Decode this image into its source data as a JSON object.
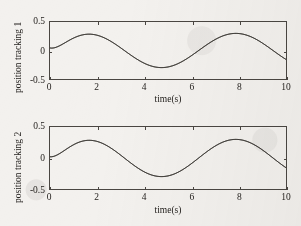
{
  "page": {
    "top_partial_text": "",
    "background_color": "#f3f1ee",
    "ink_color": "#262320",
    "curve_color": "#3a3632"
  },
  "chart_data": [
    {
      "type": "line",
      "title": "",
      "xlabel": "time(s)",
      "ylabel": "position tracking 1",
      "xlim": [
        0,
        10
      ],
      "ylim": [
        -0.5,
        0.5
      ],
      "xticks": [
        0,
        2,
        4,
        6,
        8,
        10
      ],
      "xticklabels": [
        "0",
        "2",
        "4",
        "6",
        "8",
        "10"
      ],
      "yticks": [
        -0.5,
        0,
        0.5
      ],
      "yticklabels": [
        "-0.5",
        "0",
        "0.5"
      ],
      "grid": false,
      "legend": "none",
      "series": [
        {
          "name": "reference",
          "amplitude": 0.3,
          "period": 6.3,
          "phase": 0,
          "start_value": 0.045,
          "x": [
            0,
            0.25,
            0.5,
            0.75,
            1,
            1.25,
            1.5,
            1.57,
            1.75,
            2,
            2.5,
            3,
            3.5,
            4,
            4.5,
            4.71,
            5,
            5.5,
            6,
            6.5,
            7,
            7.5,
            7.85,
            8,
            8.5,
            9,
            9.5,
            10
          ],
          "y": [
            0.0,
            0.075,
            0.147,
            0.205,
            0.252,
            0.285,
            0.299,
            0.3,
            0.297,
            0.279,
            0.213,
            0.112,
            -0.006,
            -0.121,
            -0.223,
            -0.262,
            -0.288,
            -0.299,
            -0.277,
            -0.224,
            -0.145,
            -0.045,
            0.03,
            0.063,
            0.165,
            0.245,
            0.29,
            0.272
          ]
        },
        {
          "name": "actual",
          "amplitude": 0.3,
          "period": 6.3,
          "phase": 0,
          "start_value": 0.045,
          "x": [
            0,
            0.25,
            0.5,
            0.75,
            1,
            1.25,
            1.5,
            1.57,
            1.75,
            2,
            2.5,
            3,
            3.5,
            4,
            4.5,
            4.71,
            5,
            5.5,
            6,
            6.5,
            7,
            7.5,
            7.85,
            8,
            8.5,
            9,
            9.5,
            10
          ],
          "y": [
            0.045,
            0.11,
            0.172,
            0.222,
            0.262,
            0.29,
            0.301,
            0.302,
            0.298,
            0.28,
            0.213,
            0.112,
            -0.006,
            -0.121,
            -0.223,
            -0.262,
            -0.288,
            -0.299,
            -0.277,
            -0.224,
            -0.145,
            -0.045,
            0.03,
            0.063,
            0.165,
            0.245,
            0.29,
            0.272
          ]
        }
      ]
    },
    {
      "type": "line",
      "title": "",
      "xlabel": "time(s)",
      "ylabel": "position tracking 2",
      "xlim": [
        0,
        10
      ],
      "ylim": [
        -0.5,
        0.5
      ],
      "xticks": [
        0,
        2,
        4,
        6,
        8,
        10
      ],
      "xticklabels": [
        "0",
        "2",
        "4",
        "6",
        "8",
        "10"
      ],
      "yticks": [
        -0.5,
        0,
        0.5
      ],
      "yticklabels": [
        "-0.5",
        "0",
        "0.5"
      ],
      "grid": false,
      "legend": "none",
      "series": [
        {
          "name": "reference",
          "amplitude": 0.3,
          "period": 6.3,
          "phase": 0,
          "start_value": 0.02,
          "x": [
            0,
            0.25,
            0.5,
            0.75,
            1,
            1.25,
            1.5,
            1.57,
            1.75,
            2,
            2.5,
            3,
            3.5,
            4,
            4.5,
            4.71,
            5,
            5.5,
            6,
            6.5,
            7,
            7.5,
            7.85,
            8,
            8.5,
            9,
            9.5,
            10
          ],
          "y": [
            0.0,
            0.075,
            0.147,
            0.205,
            0.252,
            0.285,
            0.299,
            0.3,
            0.297,
            0.279,
            0.213,
            0.112,
            -0.006,
            -0.121,
            -0.223,
            -0.262,
            -0.288,
            -0.299,
            -0.277,
            -0.224,
            -0.145,
            -0.045,
            0.03,
            0.063,
            0.165,
            0.245,
            0.29,
            0.272
          ]
        },
        {
          "name": "actual",
          "amplitude": 0.3,
          "period": 6.3,
          "phase": 0,
          "start_value": 0.02,
          "x": [
            0,
            0.25,
            0.5,
            0.75,
            1,
            1.25,
            1.5,
            1.57,
            1.75,
            2,
            2.5,
            3,
            3.5,
            4,
            4.5,
            4.71,
            5,
            5.5,
            6,
            6.5,
            7,
            7.5,
            7.85,
            8,
            8.5,
            9,
            9.5,
            10
          ],
          "y": [
            0.02,
            0.09,
            0.157,
            0.212,
            0.256,
            0.287,
            0.3,
            0.301,
            0.297,
            0.279,
            0.213,
            0.112,
            -0.006,
            -0.121,
            -0.223,
            -0.262,
            -0.288,
            -0.299,
            -0.277,
            -0.224,
            -0.145,
            -0.045,
            0.03,
            0.063,
            0.165,
            0.245,
            0.29,
            0.272
          ]
        }
      ]
    }
  ]
}
